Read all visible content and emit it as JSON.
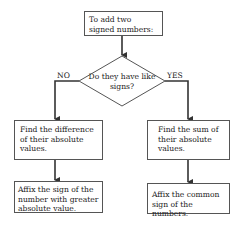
{
  "flowchart": {
    "start": {
      "text": "To add two signed numbers:"
    },
    "decision": {
      "text": "Do they have like signs?"
    },
    "branches": {
      "no": {
        "label": "NO",
        "steps": [
          "Find the difference of their absolute values.",
          "Affix the sign of the number with greater absolute value."
        ]
      },
      "yes": {
        "label": "YES",
        "steps": [
          "Find the sum of their absolute values.",
          "Affix the common sign of the numbers."
        ]
      }
    }
  }
}
